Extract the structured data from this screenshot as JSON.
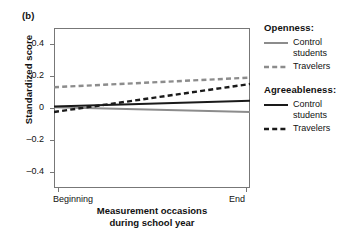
{
  "panel": {
    "label": "(b)"
  },
  "axes": {
    "y_title": "Standardized score",
    "x_title_line1": "Measurement occasions",
    "x_title_line2": "during school year",
    "y_ticks": [
      "0.4",
      "0.2",
      "0",
      "–0.2",
      "–0.4"
    ],
    "x_ticks": [
      "Beginning",
      "End"
    ]
  },
  "legend": {
    "groups": [
      {
        "heading": "Openness:",
        "entries": [
          {
            "label_line1": "Control",
            "label_line2": "students",
            "style": "solid",
            "color": "#8c8c8c"
          },
          {
            "label_line1": "Travelers",
            "label_line2": "",
            "style": "dashed",
            "color": "#8c8c8c"
          }
        ]
      },
      {
        "heading": "Agreeableness:",
        "entries": [
          {
            "label_line1": "Control",
            "label_line2": "students",
            "style": "solid",
            "color": "#1a1a1a"
          },
          {
            "label_line1": "Travelers",
            "label_line2": "",
            "style": "dashed",
            "color": "#1a1a1a"
          }
        ]
      }
    ]
  },
  "chart_data": {
    "type": "line",
    "title": "",
    "subtitle": "",
    "xlabel": "Measurement occasions during school year",
    "ylabel": "Standardized score",
    "x": [
      "Beginning",
      "End"
    ],
    "xlim": [
      0,
      1
    ],
    "ylim": [
      -0.5,
      0.5
    ],
    "yticks": [
      0.4,
      0.2,
      0,
      -0.2,
      -0.4
    ],
    "grid": false,
    "legend_position": "right",
    "series": [
      {
        "name": "Openness – Control students",
        "group": "Openness",
        "condition": "Control students",
        "style": "solid",
        "color": "#8c8c8c",
        "values": [
          0.005,
          -0.025
        ]
      },
      {
        "name": "Openness – Travelers",
        "group": "Openness",
        "condition": "Travelers",
        "style": "dashed",
        "color": "#8c8c8c",
        "values": [
          0.13,
          0.19
        ]
      },
      {
        "name": "Agreeableness – Control students",
        "group": "Agreeableness",
        "condition": "Control students",
        "style": "solid",
        "color": "#1a1a1a",
        "values": [
          0.01,
          0.045
        ]
      },
      {
        "name": "Agreeableness – Travelers",
        "group": "Agreeableness",
        "condition": "Travelers",
        "style": "dashed",
        "color": "#1a1a1a",
        "values": [
          -0.025,
          0.15
        ]
      }
    ]
  }
}
